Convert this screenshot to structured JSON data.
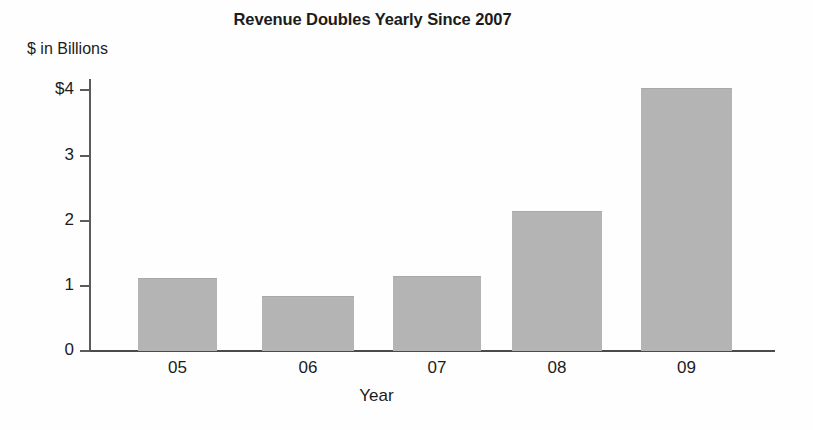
{
  "chart_data": {
    "type": "bar",
    "title": "Revenue Doubles Yearly Since 2007",
    "xlabel": "Year",
    "ylabel": "$ in Billions",
    "categories": [
      "05",
      "06",
      "07",
      "08",
      "09"
    ],
    "values": [
      1.12,
      0.84,
      1.15,
      2.15,
      4.03
    ],
    "ylim": [
      0,
      4.15
    ],
    "y_ticks": [
      0,
      1,
      2,
      3,
      4
    ],
    "y_tick_labels": [
      "0",
      "1",
      "2",
      "3",
      "4"
    ],
    "y_tick_label_top": "$4",
    "grid": false,
    "legend": false,
    "bar_color": "#b4b4b4",
    "axis_color": "#4a4a4a",
    "text_color": "#1c1c1c"
  },
  "axes": {
    "y_caption": "$ in Billions",
    "x_title": "Year",
    "y_labels": [
      "$4",
      "3",
      "2",
      "1",
      "0"
    ],
    "x_labels": [
      "05",
      "06",
      "07",
      "08",
      "09"
    ]
  },
  "title": {
    "text": "Revenue Doubles Yearly Since 2007"
  }
}
